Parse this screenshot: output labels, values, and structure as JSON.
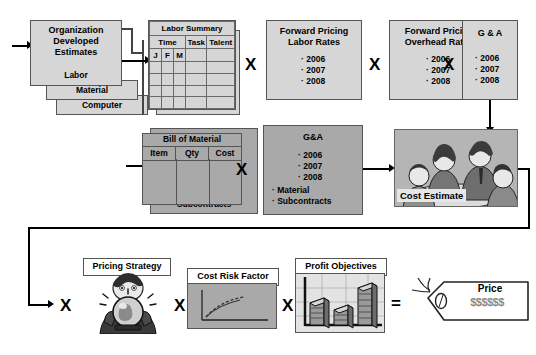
{
  "diagram": {
    "colors": {
      "light_box": "#d6d6d6",
      "dark_box": "#a9a9a9",
      "white_box": "#ffffff",
      "line": "#000000",
      "border": "#555555"
    },
    "operators": {
      "multiply": "X",
      "equals": "="
    }
  },
  "row1": {
    "stack": {
      "card_front_title": "Organization\nDeveloped\nEstimates",
      "card_front_line1": "Organization",
      "card_front_line2": "Developed",
      "card_front_line3": "Estimates",
      "card_front_label": "Labor",
      "card_mid_label": "Material",
      "card_back_label": "Computer"
    },
    "labor_summary": {
      "title": "Labor Summary",
      "columns": [
        "Time",
        "Task",
        "Talent"
      ],
      "time_subcolumns": [
        "J",
        "F",
        "M"
      ],
      "empty_rows": 4
    },
    "forward_pricing_labor": {
      "title_line1": "Forward Pricing",
      "title_line2": "Labor Rates",
      "years": [
        "2006",
        "2007",
        "2008"
      ]
    },
    "forward_pricing_overhead": {
      "title_line1": "Forward Pricing",
      "title_line2": "Overhead Rates",
      "years": [
        "2006",
        "2007",
        "2008"
      ]
    },
    "gna": {
      "title": "G & A",
      "years": [
        "2006",
        "2007",
        "2008"
      ]
    },
    "operators": [
      "X",
      "X",
      "X"
    ]
  },
  "row2": {
    "bill_of_material": {
      "title": "Bill of Material",
      "columns": [
        "Item",
        "Qty",
        "Cost"
      ],
      "back_card_label": "Subcontracts"
    },
    "gna_material": {
      "title": "G&A",
      "years": [
        "2006",
        "2007",
        "2008"
      ],
      "items": [
        "Material",
        "Subcontracts"
      ]
    },
    "cost_estimate": {
      "label": "Cost Estimate",
      "image_alt": "team-meeting-clipart"
    },
    "operators": [
      "X"
    ]
  },
  "row3": {
    "pricing_strategy": {
      "label": "Pricing Strategy",
      "image_alt": "fortune-teller-crystal-ball-clipart"
    },
    "cost_risk_factor": {
      "label": "Cost Risk Factor",
      "chart": {
        "type": "line",
        "description": "rising dashed curve on x-y axes"
      }
    },
    "profit_objectives": {
      "label": "Profit Objectives",
      "chart": {
        "type": "bar",
        "categories": [
          "1",
          "2",
          "3"
        ],
        "values": [
          55,
          40,
          85
        ],
        "ylim": [
          0,
          100
        ],
        "grid": true
      }
    },
    "price_tag": {
      "title": "Price",
      "value": "$$$$$$"
    },
    "operators": [
      "X",
      "X",
      "X",
      "="
    ]
  }
}
